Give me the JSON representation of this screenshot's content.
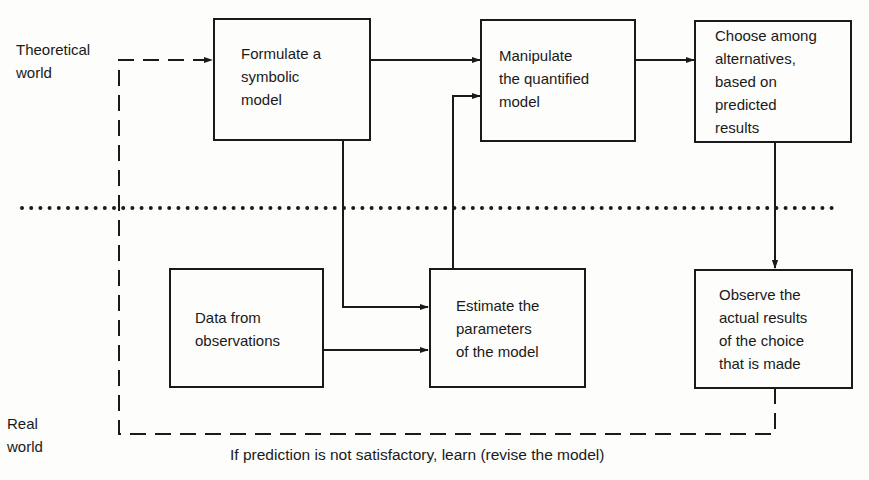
{
  "side_labels": {
    "theoretical": [
      "Theoretical",
      "world"
    ],
    "real": [
      "Real",
      "world"
    ]
  },
  "boxes": {
    "formulate": {
      "lines": [
        "Formulate a",
        "symbolic",
        "model"
      ]
    },
    "manipulate": {
      "lines": [
        "Manipulate",
        "the quantified",
        "model"
      ]
    },
    "choose": {
      "lines": [
        "Choose among",
        "alternatives,",
        "based on",
        "predicted",
        "results"
      ]
    },
    "data": {
      "lines": [
        "Data from",
        "observations"
      ]
    },
    "estimate": {
      "lines": [
        "Estimate the",
        "parameters",
        "of the model"
      ]
    },
    "observe": {
      "lines": [
        "Observe the",
        "actual results",
        "of the choice",
        "that is made"
      ]
    }
  },
  "feedback_caption": "If prediction is not satisfactory, learn (revise the model)",
  "colors": {
    "ink": "#1a1a1a",
    "paper": "#fdfdfb"
  }
}
